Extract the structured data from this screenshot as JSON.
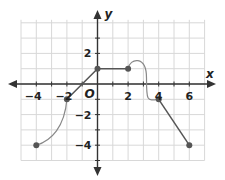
{
  "chart_data": {
    "type": "line",
    "title": "",
    "xlabel": "x",
    "ylabel": "y",
    "origin_label": "O",
    "xlim": [
      -5,
      7
    ],
    "ylim": [
      -5,
      4
    ],
    "grid": true,
    "x_tick_labels": [
      "-4",
      "-2",
      "2",
      "4",
      "6"
    ],
    "x_tick_values": [
      -4,
      -2,
      2,
      4,
      6
    ],
    "y_tick_labels": [
      "2",
      "-2",
      "-4"
    ],
    "y_tick_values": [
      2,
      -2,
      -4
    ],
    "points": [
      {
        "x": -4,
        "y": -4
      },
      {
        "x": -2,
        "y": -1
      },
      {
        "x": 0,
        "y": 1
      },
      {
        "x": 2,
        "y": 1
      },
      {
        "x": 4,
        "y": -1
      },
      {
        "x": 6,
        "y": -4
      }
    ],
    "segments": [
      {
        "from": [
          -4,
          -4
        ],
        "to": [
          -2,
          -1
        ],
        "kind": "curve",
        "note": "concave-down curve rising steeply near x=-2"
      },
      {
        "from": [
          -2,
          -1
        ],
        "to": [
          0,
          1
        ],
        "kind": "line"
      },
      {
        "from": [
          0,
          1
        ],
        "to": [
          2,
          1
        ],
        "kind": "line"
      },
      {
        "from": [
          2,
          1
        ],
        "to": [
          4,
          -1
        ],
        "kind": "curve",
        "note": "rises to peak about (2.7, 1.6), drops steeply near x=3.2, levels at (4,-1)"
      },
      {
        "from": [
          4,
          -1
        ],
        "to": [
          6,
          -4
        ],
        "kind": "line"
      }
    ],
    "colors": {
      "grid": "#d8d8d8",
      "axis": "#333333",
      "line": "#555555",
      "curve": "#888888",
      "point": "#555555"
    }
  }
}
